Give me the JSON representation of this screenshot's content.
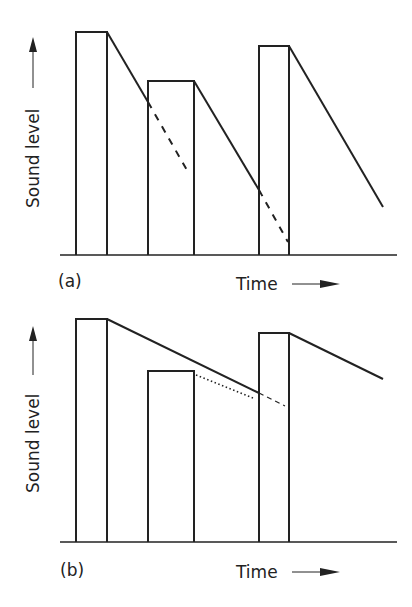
{
  "panels": [
    {
      "id": "a",
      "label": "(a)",
      "ylabel": "Sound level",
      "xlabel": "Time",
      "description": "Three sound pulses; after each pulse the level decays steeply (short reverberation). Dashed lines show continued decay extrapolated beneath the next pulse."
    },
    {
      "id": "b",
      "label": "(b)",
      "ylabel": "Sound level",
      "xlabel": "Time",
      "description": "Three sound pulses with slow decay (long reverberation); decay from the first pulse masks the second pulse. Dotted line shows decay of second pulse; dashed line shows extrapolated decay beneath third pulse."
    }
  ],
  "colors": {
    "stroke": "#222222",
    "background": "#ffffff"
  }
}
